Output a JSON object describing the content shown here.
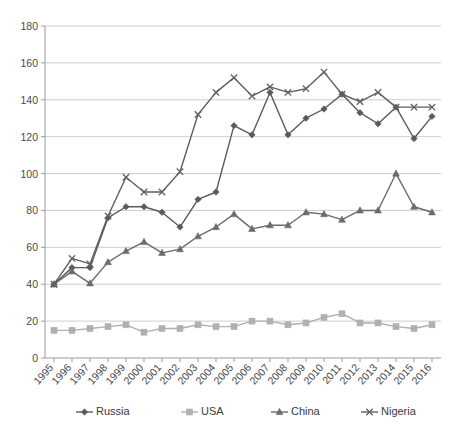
{
  "chart_data": {
    "type": "line",
    "title": "",
    "xlabel": "",
    "ylabel": "",
    "grid": true,
    "legend_position": "bottom",
    "ylim": [
      0,
      180
    ],
    "yticks": [
      0,
      20,
      40,
      60,
      80,
      100,
      120,
      140,
      160,
      180
    ],
    "categories": [
      "1995",
      "1996",
      "1997",
      "1998",
      "1999",
      "2000",
      "2001",
      "2002",
      "2003",
      "2004",
      "2005",
      "2006",
      "2007",
      "2008",
      "2009",
      "2010",
      "2011",
      "2012",
      "2013",
      "2014",
      "2015",
      "2016"
    ],
    "series": [
      {
        "name": "Russia",
        "marker": "diamond",
        "color": "#5a5a5a",
        "values": [
          40,
          49,
          49,
          76,
          82,
          82,
          79,
          71,
          86,
          90,
          126,
          121,
          144,
          121,
          130,
          135,
          143,
          133,
          127,
          136,
          119,
          131
        ]
      },
      {
        "name": "USA",
        "marker": "square",
        "color": "#b0b0b0",
        "values": [
          15,
          15,
          16,
          17,
          18,
          14,
          16,
          16,
          18,
          17,
          17,
          20,
          20,
          18,
          19,
          22,
          24,
          19,
          19,
          17,
          16,
          18
        ]
      },
      {
        "name": "China",
        "marker": "triangle",
        "color": "#6b6b6b",
        "values": [
          40,
          47,
          40.5,
          52,
          58,
          63,
          57,
          59,
          66,
          71,
          78,
          70,
          72,
          72,
          79,
          78,
          75,
          80,
          80,
          100,
          82,
          79
        ]
      },
      {
        "name": "Nigeria",
        "marker": "cross",
        "color": "#5f5f5f",
        "values": [
          40,
          54,
          51,
          77,
          98,
          90,
          90,
          101,
          132,
          144,
          152,
          142,
          147,
          144,
          146,
          155,
          143,
          139,
          144,
          136,
          136,
          136
        ]
      }
    ]
  },
  "legend": {
    "items": [
      {
        "label": "Russia"
      },
      {
        "label": "USA"
      },
      {
        "label": "China"
      },
      {
        "label": "Nigeria"
      }
    ]
  }
}
